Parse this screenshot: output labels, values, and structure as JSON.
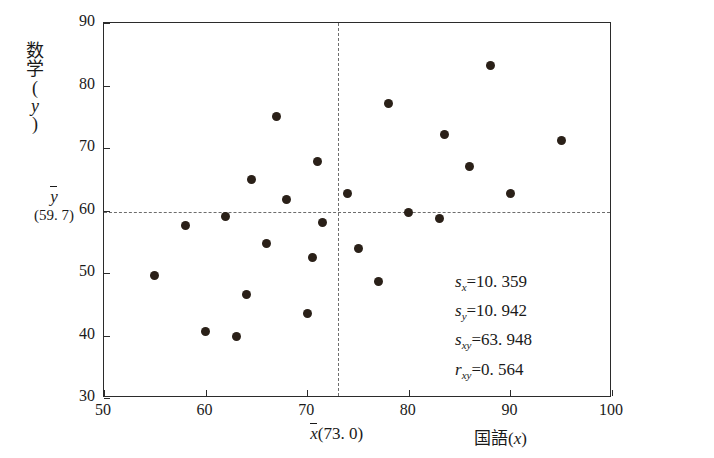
{
  "chart_data": {
    "type": "scatter",
    "title": "",
    "xlabel": "国語(x)",
    "ylabel": "数学(y)",
    "xlim": [
      50,
      100
    ],
    "ylim": [
      30,
      90
    ],
    "xticks": [
      50,
      60,
      70,
      80,
      90,
      100
    ],
    "yticks": [
      30,
      40,
      50,
      60,
      70,
      80,
      90
    ],
    "grid": false,
    "legend": "none",
    "points": [
      {
        "x": 55.0,
        "y": 49.6
      },
      {
        "x": 58.0,
        "y": 57.6
      },
      {
        "x": 60.0,
        "y": 40.7
      },
      {
        "x": 62.0,
        "y": 59.0
      },
      {
        "x": 63.0,
        "y": 39.8
      },
      {
        "x": 64.0,
        "y": 46.5
      },
      {
        "x": 64.5,
        "y": 65.0
      },
      {
        "x": 66.0,
        "y": 54.7
      },
      {
        "x": 67.0,
        "y": 75.0
      },
      {
        "x": 68.0,
        "y": 61.8
      },
      {
        "x": 70.0,
        "y": 43.5
      },
      {
        "x": 70.5,
        "y": 52.5
      },
      {
        "x": 71.0,
        "y": 67.9
      },
      {
        "x": 71.5,
        "y": 58.1
      },
      {
        "x": 74.0,
        "y": 62.8
      },
      {
        "x": 75.0,
        "y": 53.9
      },
      {
        "x": 77.0,
        "y": 48.7
      },
      {
        "x": 78.0,
        "y": 77.2
      },
      {
        "x": 80.0,
        "y": 59.7
      },
      {
        "x": 83.0,
        "y": 58.8
      },
      {
        "x": 83.5,
        "y": 72.1
      },
      {
        "x": 86.0,
        "y": 67.0
      },
      {
        "x": 88.0,
        "y": 83.2
      },
      {
        "x": 90.0,
        "y": 62.7
      },
      {
        "x": 95.0,
        "y": 71.2
      }
    ],
    "mean_lines": {
      "x_mean": 73.0,
      "y_mean": 59.7,
      "x_mean_label": "(73. 0)",
      "y_mean_label": "(59. 7)",
      "style": "dotted"
    },
    "annotations": [
      {
        "name": "sx",
        "symbol": "s",
        "sub": "x",
        "value": "10. 359"
      },
      {
        "name": "sy",
        "symbol": "s",
        "sub": "y",
        "value": "10. 942"
      },
      {
        "name": "sxy",
        "symbol": "s",
        "sub": "xy",
        "value": "63. 948"
      },
      {
        "name": "rxy",
        "symbol": "r",
        "sub": "xy",
        "value": "0. 564"
      }
    ]
  },
  "axis": {
    "x_title_main": "国語",
    "x_title_open": "(",
    "x_title_var": "x",
    "x_title_close": ")",
    "y_title_chars": [
      "数",
      "学",
      "(",
      "y",
      ")"
    ],
    "xbar_var": "x",
    "xbar_value": "(73. 0)",
    "ybar_var": "y",
    "ybar_value": "(59. 7)"
  },
  "ticks": {
    "x": [
      "50",
      "60",
      "70",
      "80",
      "90",
      "100"
    ],
    "y": [
      "30",
      "40",
      "50",
      "60",
      "70",
      "80",
      "90"
    ]
  }
}
